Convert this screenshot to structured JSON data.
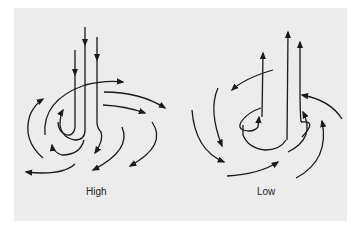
{
  "diagram": {
    "type": "airflow-streamline-diagram",
    "panels": [
      {
        "id": "high",
        "label": "High",
        "description": "Air descends vertically and spirals outward (divergent, clockwise outflow)",
        "flow": "descending-outward"
      },
      {
        "id": "low",
        "label": "Low",
        "description": "Air spirals inward (convergent, counterclockwise inflow) and rises vertically",
        "flow": "converging-ascending"
      }
    ],
    "colors": {
      "background": "#ececec",
      "stroke": "#1a1a1a",
      "text": "#222222"
    }
  }
}
